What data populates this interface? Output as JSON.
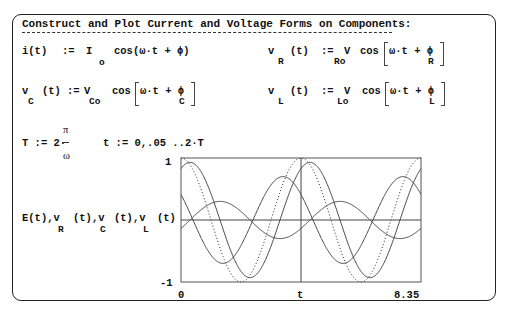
{
  "title": "Construct and Plot Current and Voltage Forms on Components:",
  "equations": {
    "i": {
      "lhs": "i(t)",
      "assign": ":=",
      "coef": "I",
      "coef_sub": "o",
      "func": "cos(ω·t + ϕ)"
    },
    "vR": {
      "lhs": "v",
      "lhs_sub": "R",
      "arg": "(t)",
      "assign": ":=",
      "coef": "V",
      "coef_sub": "Ro",
      "func": "cos",
      "inner": "ω·t + ϕ",
      "inner_sub": "R"
    },
    "vC": {
      "lhs": "v",
      "lhs_sub": "C",
      "arg": "(t)",
      "assign": ":=",
      "coef": "V",
      "coef_sub": "Co",
      "func": "cos",
      "inner": "ω·t + ϕ",
      "inner_sub": "C"
    },
    "vL": {
      "lhs": "v",
      "lhs_sub": "L",
      "arg": "(t)",
      "assign": ":=",
      "coef": "V",
      "coef_sub": "Lo",
      "func": "cos",
      "inner": "ω·t + ϕ",
      "inner_sub": "L"
    },
    "T": {
      "lhs": "T := 2·",
      "num": "π",
      "den": "ω"
    },
    "t_range": {
      "text": "t := 0,.05 ..2·T"
    }
  },
  "plot": {
    "ylabel": {
      "p1": "E(t),v",
      "s1": "R",
      "p2": "(t),v",
      "s2": "C",
      "p3": "(t),v",
      "s3": "L",
      "p4": "(t)"
    },
    "ytick_top": "1",
    "ytick_bottom": "-1",
    "xtick_left": "0",
    "xlabel": "t",
    "xtick_right": "8.35"
  },
  "chart_data": {
    "type": "line",
    "title": "",
    "xlabel": "t",
    "ylabel": "E(t), vR(t), vC(t), vL(t)",
    "xlim": [
      0,
      8.35
    ],
    "ylim": [
      -1,
      1
    ],
    "x_marker": 4.175,
    "period": 4.175,
    "series": [
      {
        "name": "E(t)",
        "style": "dotted",
        "amplitude": 1.0,
        "phase_deg": 0
      },
      {
        "name": "vR(t)",
        "style": "solid",
        "amplitude": 0.93,
        "phase_deg": -27
      },
      {
        "name": "vC(t)",
        "style": "solid",
        "amplitude": 0.7,
        "phase_deg": 54
      },
      {
        "name": "vL(t)",
        "style": "solid",
        "amplitude": 0.3,
        "phase_deg": -117
      }
    ]
  }
}
